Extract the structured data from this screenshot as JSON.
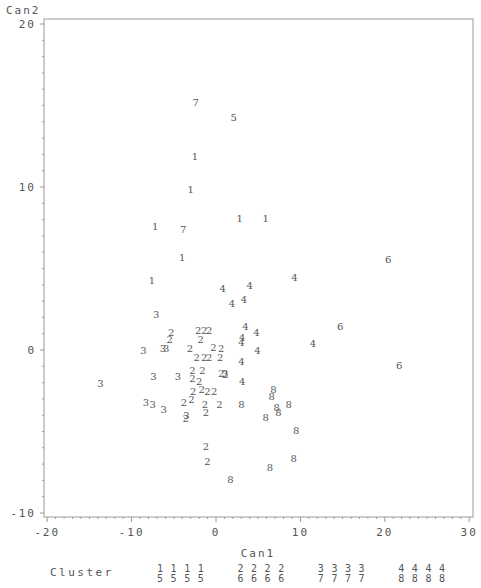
{
  "chart_data": {
    "type": "scatter",
    "title": "",
    "xlabel": "Can1",
    "ylabel": "Can2",
    "xlim": [
      -20,
      30
    ],
    "ylim": [
      -10,
      20
    ],
    "x_ticks": [
      -20,
      -10,
      0,
      10,
      20,
      30
    ],
    "y_ticks": [
      -10,
      0,
      10,
      20
    ],
    "x_tick_labels": [
      "-20",
      "-10",
      "0",
      "10",
      "20",
      "30"
    ],
    "y_tick_labels": [
      "-10",
      "0",
      "10",
      "20"
    ],
    "grid": false,
    "marker": "cluster number as text symbol",
    "legend": {
      "title": "Cluster",
      "position": "bottom",
      "entries": [
        {
          "top": "1",
          "bottom": "5",
          "count": 4
        },
        {
          "top": "2",
          "bottom": "6",
          "count": 4
        },
        {
          "top": "3",
          "bottom": "7",
          "count": 4
        },
        {
          "top": "4",
          "bottom": "8",
          "count": 4
        }
      ]
    },
    "series": [
      {
        "name": "1",
        "points": [
          [
            -2.5,
            11.9
          ],
          [
            -3.0,
            9.9
          ],
          [
            -7.2,
            7.6
          ],
          [
            2.8,
            8.1
          ],
          [
            5.9,
            8.1
          ],
          [
            -4.0,
            5.7
          ],
          [
            -7.6,
            4.3
          ]
        ]
      },
      {
        "name": "2",
        "points": [
          [
            -5.3,
            1.1
          ],
          [
            -5.5,
            0.7
          ],
          [
            -2.1,
            1.2
          ],
          [
            -1.4,
            1.2
          ],
          [
            -0.8,
            1.2
          ],
          [
            -1.8,
            0.7
          ],
          [
            -0.3,
            0.2
          ],
          [
            -3.1,
            0.1
          ],
          [
            -2.3,
            -0.4
          ],
          [
            -1.4,
            -0.4
          ],
          [
            -0.8,
            -0.4
          ],
          [
            0.6,
            0.1
          ],
          [
            0.5,
            -0.4
          ],
          [
            -2.8,
            -1.2
          ],
          [
            -1.6,
            -1.2
          ],
          [
            -2.8,
            -1.7
          ],
          [
            -2.0,
            -1.9
          ],
          [
            -1.7,
            -2.4
          ],
          [
            -2.7,
            -2.5
          ],
          [
            -1.0,
            -2.5
          ],
          [
            -0.2,
            -2.5
          ],
          [
            0.6,
            -1.4
          ],
          [
            1.1,
            -1.5
          ],
          [
            -3.8,
            -3.2
          ],
          [
            -2.9,
            -3.0
          ],
          [
            -1.3,
            -3.3
          ],
          [
            0.4,
            -3.3
          ],
          [
            -1.2,
            -3.8
          ],
          [
            -3.6,
            -4.2
          ],
          [
            -1.2,
            -5.9
          ],
          [
            -1.0,
            -6.8
          ]
        ]
      },
      {
        "name": "3",
        "points": [
          [
            -13.7,
            -2.0
          ],
          [
            -7.1,
            2.2
          ],
          [
            -8.6,
            0.0
          ],
          [
            -6.3,
            0.1
          ],
          [
            -5.9,
            0.1
          ],
          [
            -7.4,
            -1.6
          ],
          [
            -4.5,
            -1.6
          ],
          [
            -8.3,
            -3.2
          ],
          [
            -7.5,
            -3.3
          ],
          [
            -6.2,
            -3.6
          ],
          [
            -3.5,
            -4.0
          ],
          [
            1.1,
            -1.4
          ]
        ]
      },
      {
        "name": "4",
        "points": [
          [
            0.8,
            3.8
          ],
          [
            1.9,
            2.9
          ],
          [
            4.0,
            4.0
          ],
          [
            9.3,
            4.5
          ],
          [
            3.3,
            3.1
          ],
          [
            3.5,
            1.5
          ],
          [
            4.8,
            1.1
          ],
          [
            3.1,
            0.8
          ],
          [
            3.0,
            0.5
          ],
          [
            4.9,
            0.0
          ],
          [
            3.0,
            -0.7
          ],
          [
            11.5,
            0.4
          ],
          [
            3.1,
            -1.9
          ]
        ]
      },
      {
        "name": "5",
        "points": [
          [
            2.1,
            14.3
          ]
        ]
      },
      {
        "name": "6",
        "points": [
          [
            20.4,
            5.6
          ],
          [
            14.7,
            1.5
          ],
          [
            21.7,
            -0.9
          ]
        ]
      },
      {
        "name": "7",
        "points": [
          [
            -2.4,
            15.2
          ],
          [
            -3.9,
            7.4
          ]
        ]
      },
      {
        "name": "8",
        "points": [
          [
            6.8,
            -2.4
          ],
          [
            6.6,
            -2.8
          ],
          [
            7.2,
            -3.5
          ],
          [
            7.4,
            -3.8
          ],
          [
            8.6,
            -3.3
          ],
          [
            3.0,
            -3.3
          ],
          [
            5.9,
            -4.1
          ],
          [
            9.5,
            -4.9
          ],
          [
            9.2,
            -6.6
          ],
          [
            6.4,
            -7.2
          ],
          [
            1.7,
            -7.9
          ]
        ]
      }
    ]
  }
}
